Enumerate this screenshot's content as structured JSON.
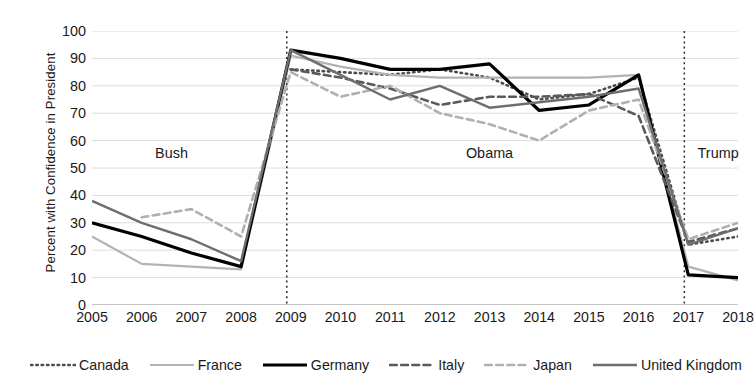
{
  "chart_data": {
    "type": "line",
    "title": "",
    "xlabel": "",
    "ylabel": "Percent with Confidence in President",
    "x": [
      2005,
      2006,
      2007,
      2008,
      2009,
      2010,
      2011,
      2012,
      2013,
      2014,
      2015,
      2016,
      2017,
      2018
    ],
    "xtick_labels": [
      "2005",
      "2006",
      "2007",
      "2008",
      "2009",
      "2010",
      "2011",
      "2012",
      "2013",
      "2014",
      "2015",
      "2016",
      "2017",
      "2018"
    ],
    "ytick_labels": [
      "0",
      "10",
      "20",
      "30",
      "40",
      "50",
      "60",
      "70",
      "80",
      "90",
      "100"
    ],
    "ylim": [
      0,
      100
    ],
    "ytick_step": 10,
    "grid": "horizontal",
    "legend_position": "bottom",
    "series": [
      {
        "name": "Canada",
        "style": "dotted",
        "color": "#4d4d4d",
        "width": 2.6,
        "values": [
          null,
          null,
          null,
          null,
          86,
          85,
          84,
          86,
          83,
          75,
          77,
          83,
          22,
          25
        ]
      },
      {
        "name": "France",
        "style": "solid",
        "color": "#b3b3b3",
        "width": 2.2,
        "values": [
          25,
          15,
          14,
          13,
          91,
          87,
          84,
          83,
          83,
          83,
          83,
          84,
          14,
          9
        ]
      },
      {
        "name": "Germany",
        "style": "solid",
        "color": "#000000",
        "width": 3.2,
        "values": [
          30,
          25,
          19,
          14,
          93,
          90,
          86,
          86,
          88,
          71,
          73,
          84,
          11,
          10
        ]
      },
      {
        "name": "Italy",
        "style": "dashed",
        "color": "#595959",
        "width": 2.6,
        "values": [
          null,
          null,
          null,
          null,
          86,
          83,
          79,
          73,
          76,
          76,
          77,
          69,
          23,
          28
        ]
      },
      {
        "name": "Japan",
        "style": "dashed",
        "color": "#b0b0b0",
        "width": 2.6,
        "values": [
          null,
          32,
          35,
          25,
          85,
          76,
          80,
          70,
          66,
          60,
          71,
          75,
          24,
          30
        ]
      },
      {
        "name": "United Kingdom",
        "style": "solid",
        "color": "#6e6e6e",
        "width": 2.4,
        "values": [
          38,
          30,
          24,
          16,
          93,
          84,
          75,
          80,
          72,
          74,
          76,
          79,
          22,
          28
        ]
      }
    ],
    "annotations": [
      {
        "label": "Bush",
        "x": 2006.6,
        "y": 55
      },
      {
        "label": "Obama",
        "x": 2013.0,
        "y": 55
      },
      {
        "label": "Trump",
        "x": 2017.6,
        "y": 55
      }
    ],
    "dividers": [
      {
        "x": 2008.92
      },
      {
        "x": 2016.92
      }
    ]
  }
}
